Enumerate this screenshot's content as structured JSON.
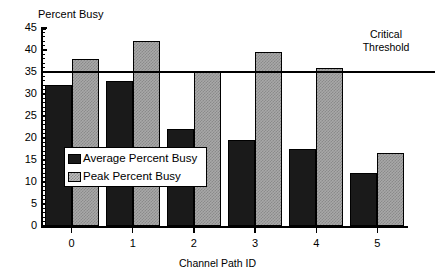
{
  "chart_data": {
    "type": "bar",
    "title": "",
    "ylabel": "Percent Busy",
    "xlabel": "Channel Path ID",
    "categories": [
      "0",
      "1",
      "2",
      "3",
      "4",
      "5"
    ],
    "series": [
      {
        "name": "Average Percent Busy",
        "color": "#1a1a1a",
        "values": [
          32,
          33,
          22,
          19.5,
          17.5,
          12
        ]
      },
      {
        "name": "Peak Percent Busy",
        "color": "#a8a8a8",
        "values": [
          38,
          42,
          35,
          39.5,
          36,
          16.5
        ]
      }
    ],
    "ylim": [
      0,
      45
    ],
    "ytick_labels": [
      "0",
      "5",
      "10",
      "15",
      "20",
      "25",
      "30",
      "35",
      "40",
      "45"
    ],
    "ytick_values": [
      0,
      5,
      10,
      15,
      20,
      25,
      30,
      35,
      40,
      45
    ],
    "grid": false,
    "legend_position": "center-left-inside",
    "annotations": [
      {
        "name": "critical-threshold",
        "label_line1": "Critical",
        "label_line2": "Threshold",
        "value": 35,
        "type": "horizontal-line"
      }
    ]
  },
  "legend": {
    "entries": [
      {
        "label": "Average Percent Busy"
      },
      {
        "label": "Peak Percent Busy"
      }
    ]
  }
}
